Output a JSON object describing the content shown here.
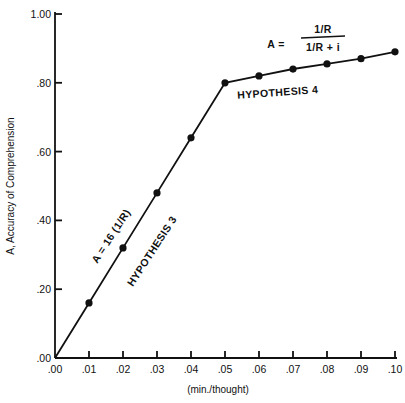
{
  "chart_data": {
    "type": "line",
    "title": "",
    "xlabel": "(min./thought)",
    "ylabel": "A, Accuracy of Comprehension",
    "xlim": [
      0.0,
      0.1
    ],
    "ylim": [
      0.0,
      1.0
    ],
    "grid": false,
    "x_ticks": [
      ".00",
      ".01",
      ".02",
      ".03",
      ".04",
      ".05",
      ".06",
      ".07",
      ".08",
      ".09",
      ".10"
    ],
    "y_ticks": [
      ".00",
      ".20",
      ".40",
      ".60",
      ".80",
      "1.00"
    ],
    "x": [
      0.0,
      0.01,
      0.02,
      0.03,
      0.04,
      0.05,
      0.06,
      0.07,
      0.08,
      0.09,
      0.1
    ],
    "series": [
      {
        "name": "Accuracy",
        "values": [
          0.0,
          0.16,
          0.32,
          0.48,
          0.64,
          0.8,
          0.82,
          0.84,
          0.855,
          0.87,
          0.89
        ],
        "markers": [
          false,
          true,
          true,
          true,
          true,
          true,
          true,
          true,
          true,
          true,
          true
        ]
      }
    ],
    "annotations": [
      {
        "id": "formula3",
        "text": "A = 16 (1/R)",
        "rotation": -57
      },
      {
        "id": "hyp3",
        "text": "HYPOTHESIS 3",
        "rotation": -57
      },
      {
        "id": "formula4_lhs",
        "text": "A ="
      },
      {
        "id": "formula4_num",
        "text": "1/R"
      },
      {
        "id": "formula4_den",
        "text": "1/R + i"
      },
      {
        "id": "hyp4",
        "text": "HYPOTHESIS 4",
        "rotation": -4
      }
    ]
  },
  "labels": {
    "xlabel": "(min./thought)",
    "ylabel": "A, Accuracy of Comprehension",
    "formula3": "A = 16 (1/R)",
    "hyp3": "HYPOTHESIS 3",
    "formula4_lhs": "A =",
    "formula4_num": "1/R",
    "formula4_den": "1/R + i",
    "hyp4": "HYPOTHESIS 4",
    "x_ticks": [
      ".00",
      ".01",
      ".02",
      ".03",
      ".04",
      ".05",
      ".06",
      ".07",
      ".08",
      ".09",
      ".10"
    ],
    "y_ticks": [
      ".00",
      ".20",
      ".40",
      ".60",
      ".80",
      "1.00"
    ]
  }
}
